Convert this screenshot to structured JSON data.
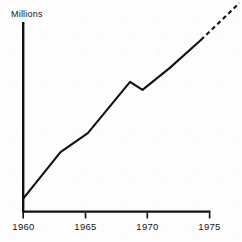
{
  "chart_data": {
    "type": "line",
    "title": "",
    "subtitle": "",
    "xlabel": "",
    "ylabel": "Millions",
    "ylabel_position": "top-left",
    "grid": false,
    "legend": false,
    "legend_position": "none",
    "xlim": [
      1960,
      1975
    ],
    "ylim": [
      0,
      100
    ],
    "x_tick_labels": [
      "1960",
      "1965",
      "1970",
      "1975"
    ],
    "x_ticks": [
      1960,
      1965,
      1970,
      1975
    ],
    "y_tick_labels": [],
    "y_ticks": [],
    "series": [
      {
        "name": "Millions",
        "style": "solid",
        "note": "observed data 1960-1974",
        "x": [
          1960.0,
          1963.0,
          1965.2,
          1968.6,
          1969.6,
          1971.8,
          1974.3
        ],
        "values": [
          6.8,
          31.4,
          41.4,
          68.4,
          64.2,
          75.8,
          90.5
        ]
      },
      {
        "name": "Millions (projected)",
        "style": "dashed",
        "note": "projection beyond 1974",
        "x": [
          1974.3,
          1977.4
        ],
        "values": [
          90.5,
          110.0
        ]
      }
    ],
    "annotations": [
      {
        "label": "Millions",
        "type": "axis-unit-caption"
      }
    ],
    "colors": {
      "line": "#101010",
      "axis": "#111111",
      "text": "#151515",
      "background": "#fdfdfd"
    }
  },
  "axis": {
    "y_caption": "Millions",
    "x_tick_1": "1960",
    "x_tick_2": "1965",
    "x_tick_3": "1970",
    "x_tick_4": "1975"
  }
}
